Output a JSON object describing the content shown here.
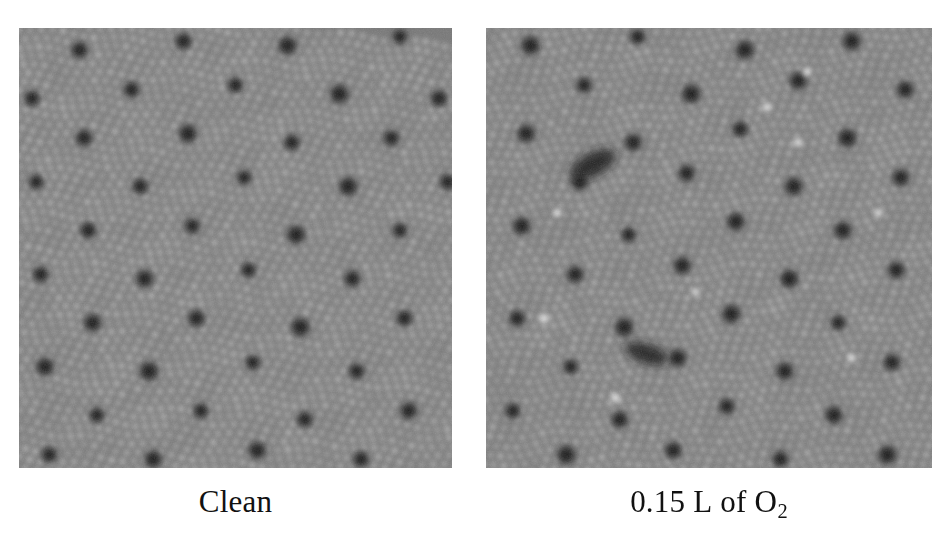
{
  "figure": {
    "background_color": "#ffffff",
    "caption_color": "#111111",
    "panels": [
      {
        "id": "clean",
        "caption": "Clean",
        "caption_plain": "Clean",
        "x": 19,
        "y": 28,
        "width": 433,
        "height": 440
      },
      {
        "id": "oxygen",
        "caption_number": "0.15",
        "caption_unit": "L",
        "caption_connector": "of",
        "caption_species": "O",
        "caption_species_sub": "2",
        "caption_plain": "0.15 L of O2",
        "x": 486,
        "y": 28,
        "width": 446,
        "height": 440
      }
    ]
  },
  "chart_data": {
    "type": "heatmap",
    "title": "",
    "subtitle": "",
    "xlabel": "",
    "ylabel": "",
    "grid": false,
    "legend_position": "none",
    "colormap": "grayscale",
    "value_range": [
      0,
      255
    ],
    "tone_levels": {
      "dark_hole": 18,
      "dark_ring": 70,
      "background": 128,
      "protrusion": 196,
      "bright_adsorbate": 252
    },
    "panels": [
      {
        "name": "Clean",
        "label": "Clean",
        "description": "STM topograph of a clean quasicrystalline surface: dense quasiperiodic lattice of bright protrusions with a quasiperiodic arrangement of large dark holes.",
        "lattice": {
          "fine_protrusion_spacing_px": 10.5,
          "dark_hole_spacing_px": 47,
          "symmetry": "quasiperiodic-pentagonal",
          "rotation_deg": 6
        },
        "dark_holes": [
          [
            0.14,
            0.05
          ],
          [
            0.38,
            0.03
          ],
          [
            0.62,
            0.04
          ],
          [
            0.88,
            0.02
          ],
          [
            0.03,
            0.16
          ],
          [
            0.26,
            0.14
          ],
          [
            0.5,
            0.13
          ],
          [
            0.74,
            0.15
          ],
          [
            0.97,
            0.16
          ],
          [
            0.15,
            0.25
          ],
          [
            0.39,
            0.24
          ],
          [
            0.63,
            0.26
          ],
          [
            0.86,
            0.25
          ],
          [
            0.04,
            0.35
          ],
          [
            0.28,
            0.36
          ],
          [
            0.52,
            0.34
          ],
          [
            0.76,
            0.36
          ],
          [
            0.99,
            0.35
          ],
          [
            0.16,
            0.46
          ],
          [
            0.4,
            0.45
          ],
          [
            0.64,
            0.47
          ],
          [
            0.88,
            0.46
          ],
          [
            0.05,
            0.56
          ],
          [
            0.29,
            0.57
          ],
          [
            0.53,
            0.55
          ],
          [
            0.77,
            0.57
          ],
          [
            0.17,
            0.67
          ],
          [
            0.41,
            0.66
          ],
          [
            0.65,
            0.68
          ],
          [
            0.89,
            0.66
          ],
          [
            0.06,
            0.77
          ],
          [
            0.3,
            0.78
          ],
          [
            0.54,
            0.76
          ],
          [
            0.78,
            0.78
          ],
          [
            0.18,
            0.88
          ],
          [
            0.42,
            0.87
          ],
          [
            0.66,
            0.89
          ],
          [
            0.9,
            0.87
          ],
          [
            0.07,
            0.97
          ],
          [
            0.31,
            0.98
          ],
          [
            0.55,
            0.96
          ],
          [
            0.79,
            0.98
          ]
        ],
        "bright_adsorbates": [],
        "dark_defects": []
      },
      {
        "name": "0.15 L of O2",
        "label": "0.15 L of O2",
        "description": "Same surface after 0.15 langmuir oxygen exposure: identical quasiperiodic lattice plus several bright adsorbate features and two elongated dark defect clusters.",
        "lattice": {
          "fine_protrusion_spacing_px": 10.5,
          "dark_hole_spacing_px": 47,
          "symmetry": "quasiperiodic-pentagonal",
          "rotation_deg": -4
        },
        "dark_holes": [
          [
            0.1,
            0.04
          ],
          [
            0.34,
            0.02
          ],
          [
            0.58,
            0.05
          ],
          [
            0.82,
            0.03
          ],
          [
            0.22,
            0.13
          ],
          [
            0.46,
            0.15
          ],
          [
            0.7,
            0.12
          ],
          [
            0.94,
            0.14
          ],
          [
            0.09,
            0.24
          ],
          [
            0.33,
            0.26
          ],
          [
            0.57,
            0.23
          ],
          [
            0.81,
            0.25
          ],
          [
            0.21,
            0.35
          ],
          [
            0.45,
            0.33
          ],
          [
            0.69,
            0.36
          ],
          [
            0.93,
            0.34
          ],
          [
            0.08,
            0.45
          ],
          [
            0.32,
            0.47
          ],
          [
            0.56,
            0.44
          ],
          [
            0.8,
            0.46
          ],
          [
            0.2,
            0.56
          ],
          [
            0.44,
            0.54
          ],
          [
            0.68,
            0.57
          ],
          [
            0.92,
            0.55
          ],
          [
            0.07,
            0.66
          ],
          [
            0.31,
            0.68
          ],
          [
            0.55,
            0.65
          ],
          [
            0.79,
            0.67
          ],
          [
            0.19,
            0.77
          ],
          [
            0.43,
            0.75
          ],
          [
            0.67,
            0.78
          ],
          [
            0.91,
            0.76
          ],
          [
            0.06,
            0.87
          ],
          [
            0.3,
            0.89
          ],
          [
            0.54,
            0.86
          ],
          [
            0.78,
            0.88
          ],
          [
            0.18,
            0.97
          ],
          [
            0.42,
            0.96
          ],
          [
            0.66,
            0.98
          ],
          [
            0.9,
            0.97
          ]
        ],
        "bright_adsorbates": [
          [
            0.72,
            0.1
          ],
          [
            0.63,
            0.18
          ],
          [
            0.7,
            0.26
          ],
          [
            0.16,
            0.42
          ],
          [
            0.13,
            0.66
          ],
          [
            0.88,
            0.42
          ],
          [
            0.29,
            0.84
          ],
          [
            0.82,
            0.75
          ],
          [
            0.47,
            0.6
          ]
        ],
        "dark_defects": [
          {
            "cx": 0.24,
            "cy": 0.31,
            "rx": 0.055,
            "ry": 0.026,
            "angle": -28
          },
          {
            "cx": 0.36,
            "cy": 0.74,
            "rx": 0.05,
            "ry": 0.022,
            "angle": 18
          }
        ]
      }
    ]
  }
}
